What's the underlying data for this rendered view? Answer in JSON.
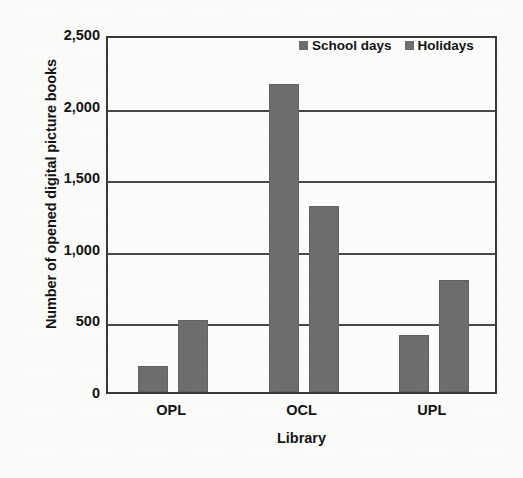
{
  "chart_data": {
    "type": "bar",
    "title": "",
    "xlabel": "Library",
    "ylabel": "Number of opened digital picture books",
    "categories": [
      "OPL",
      "OCL",
      "UPL"
    ],
    "series": [
      {
        "name": "School days",
        "values": [
          180,
          2150,
          400
        ],
        "color": "#6e6e6e"
      },
      {
        "name": "Holidays",
        "values": [
          500,
          1300,
          780
        ],
        "color": "#6e6e6e"
      }
    ],
    "ylim": [
      0,
      2500
    ],
    "ytick_values": [
      0,
      500,
      1000,
      1500,
      2000,
      2500
    ],
    "ytick_labels": [
      "0",
      "500",
      "1,000",
      "1,500",
      "2,000",
      "2,500"
    ],
    "grid": "horizontal",
    "legend_position": "top-right",
    "bar_color": "#6e6e6e",
    "axis_color": "#3a3a3a",
    "background": "#fbfbfa"
  },
  "legend": {
    "items": [
      {
        "label": "School days",
        "swatch": "legend-swatch-school-days"
      },
      {
        "label": "Holidays",
        "swatch": "legend-swatch-holidays"
      }
    ]
  }
}
